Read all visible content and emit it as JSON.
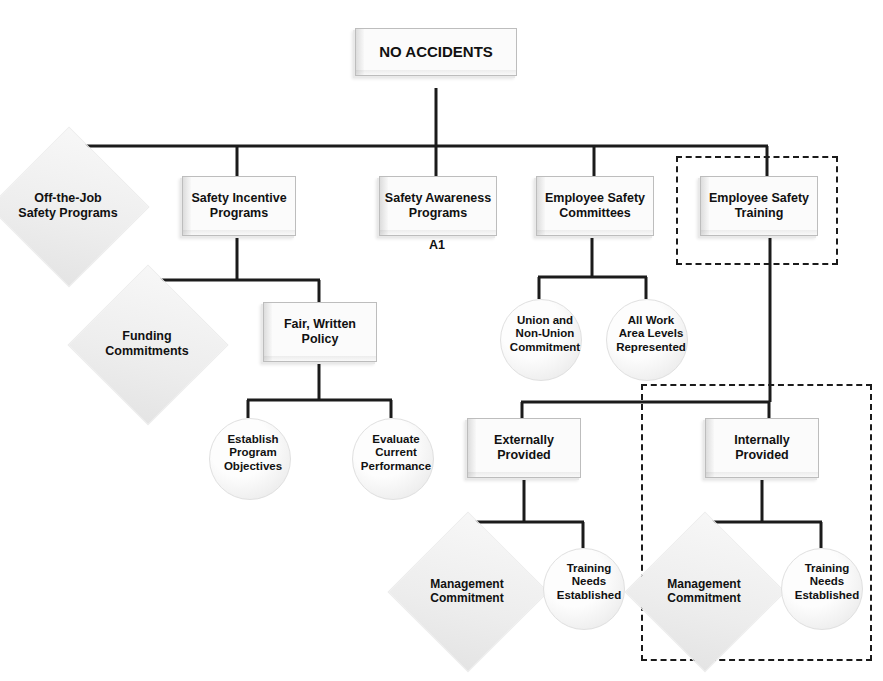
{
  "diagram": {
    "root": {
      "label": "NO ACCIDENTS",
      "shape": "rectangle"
    },
    "annotations": [
      {
        "id": "a1",
        "text": "A1"
      }
    ],
    "dashed_groups": [
      {
        "id": "group-employee-safety-training",
        "note": "dashed boundary around Employee Safety Training"
      },
      {
        "id": "group-internally-provided",
        "note": "dashed boundary around Internally Provided branch"
      }
    ],
    "nodes": [
      {
        "id": "no-accidents",
        "label": "NO ACCIDENTS",
        "shape": "rectangle"
      },
      {
        "id": "off-the-job",
        "label": "Off-the-Job\nSafety Programs",
        "shape": "diamond"
      },
      {
        "id": "safety-incentive",
        "label": "Safety Incentive\nPrograms",
        "shape": "rectangle"
      },
      {
        "id": "safety-awareness",
        "label": "Safety Awareness\nPrograms",
        "shape": "rectangle"
      },
      {
        "id": "employee-committees",
        "label": "Employee Safety\nCommittees",
        "shape": "rectangle"
      },
      {
        "id": "employee-training",
        "label": "Employee Safety\nTraining",
        "shape": "rectangle"
      },
      {
        "id": "funding-commitments",
        "label": "Funding\nCommitments",
        "shape": "diamond"
      },
      {
        "id": "fair-written-policy",
        "label": "Fair, Written\nPolicy",
        "shape": "rectangle"
      },
      {
        "id": "union-non-union",
        "label": "Union and\nNon-Union\nCommitment",
        "shape": "circle"
      },
      {
        "id": "all-work-area-levels",
        "label": "All Work\nArea Levels\nRepresented",
        "shape": "circle"
      },
      {
        "id": "establish-objectives",
        "label": "Establish\nProgram\nObjectives",
        "shape": "circle"
      },
      {
        "id": "evaluate-performance",
        "label": "Evaluate\nCurrent\nPerformance",
        "shape": "circle"
      },
      {
        "id": "externally-provided",
        "label": "Externally\nProvided",
        "shape": "rectangle"
      },
      {
        "id": "internally-provided",
        "label": "Internally\nProvided",
        "shape": "rectangle"
      },
      {
        "id": "ext-management-commitment",
        "label": "Management\nCommitment",
        "shape": "diamond"
      },
      {
        "id": "ext-training-needs",
        "label": "Training\nNeeds\nEstablished",
        "shape": "circle"
      },
      {
        "id": "int-management-commitment",
        "label": "Management\nCommitment",
        "shape": "diamond"
      },
      {
        "id": "int-training-needs",
        "label": "Training\nNeeds\nEstablished",
        "shape": "circle"
      }
    ],
    "labels": {
      "no_accidents": "NO ACCIDENTS",
      "off_the_job": "Off-the-Job\nSafety Programs",
      "safety_incentive": "Safety Incentive\nPrograms",
      "safety_awareness": "Safety Awareness\nPrograms",
      "employee_committees": "Employee Safety\nCommittees",
      "employee_training": "Employee Safety\nTraining",
      "a1": "A1",
      "funding_commitments": "Funding\nCommitments",
      "fair_written_policy": "Fair, Written\nPolicy",
      "union_non_union": "Union and\nNon-Union\nCommitment",
      "all_work_area_levels": "All Work\nArea Levels\nRepresented",
      "establish_objectives": "Establish\nProgram\nObjectives",
      "evaluate_performance": "Evaluate\nCurrent\nPerformance",
      "externally_provided": "Externally\nProvided",
      "internally_provided": "Internally\nProvided",
      "ext_management_commitment": "Management\nCommitment",
      "ext_training_needs": "Training\nNeeds\nEstablished",
      "int_management_commitment": "Management\nCommitment",
      "int_training_needs": "Training\nNeeds\nEstablished"
    },
    "edges": [
      {
        "from": "no-accidents",
        "to": "off-the-job"
      },
      {
        "from": "no-accidents",
        "to": "safety-incentive"
      },
      {
        "from": "no-accidents",
        "to": "safety-awareness"
      },
      {
        "from": "no-accidents",
        "to": "employee-committees"
      },
      {
        "from": "no-accidents",
        "to": "employee-training"
      },
      {
        "from": "safety-incentive",
        "to": "funding-commitments"
      },
      {
        "from": "safety-incentive",
        "to": "fair-written-policy"
      },
      {
        "from": "employee-committees",
        "to": "union-non-union"
      },
      {
        "from": "employee-committees",
        "to": "all-work-area-levels"
      },
      {
        "from": "fair-written-policy",
        "to": "establish-objectives"
      },
      {
        "from": "fair-written-policy",
        "to": "evaluate-performance"
      },
      {
        "from": "employee-training",
        "to": "externally-provided"
      },
      {
        "from": "employee-training",
        "to": "internally-provided"
      },
      {
        "from": "externally-provided",
        "to": "ext-management-commitment"
      },
      {
        "from": "externally-provided",
        "to": "ext-training-needs"
      },
      {
        "from": "internally-provided",
        "to": "int-management-commitment"
      },
      {
        "from": "internally-provided",
        "to": "int-training-needs"
      }
    ],
    "colors": {
      "line": "#1b1b1b",
      "text": "#111111",
      "node_fill": "#f5f5f5",
      "node_border": "#bdbdbd",
      "background": "#ffffff"
    }
  }
}
